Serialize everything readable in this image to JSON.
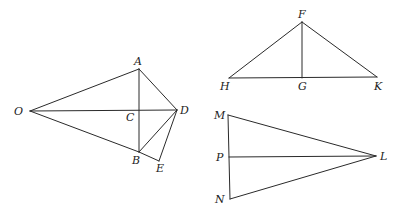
{
  "figures": [
    {
      "name": "kite-figure",
      "points": [
        "O",
        "A",
        "B",
        "C",
        "D",
        "E"
      ],
      "segments": [
        [
          "O",
          "A"
        ],
        [
          "O",
          "B"
        ],
        [
          "O",
          "D"
        ],
        [
          "A",
          "B"
        ],
        [
          "A",
          "D"
        ],
        [
          "B",
          "D"
        ],
        [
          "B",
          "E"
        ],
        [
          "D",
          "E"
        ]
      ]
    },
    {
      "name": "triangle-fhk",
      "points": [
        "F",
        "G",
        "H",
        "K"
      ],
      "segments": [
        [
          "F",
          "H"
        ],
        [
          "F",
          "K"
        ],
        [
          "H",
          "K"
        ],
        [
          "F",
          "G"
        ]
      ]
    },
    {
      "name": "triangle-lmn",
      "points": [
        "L",
        "M",
        "N",
        "P"
      ],
      "segments": [
        [
          "M",
          "L"
        ],
        [
          "N",
          "L"
        ],
        [
          "M",
          "N"
        ],
        [
          "P",
          "L"
        ]
      ]
    }
  ],
  "labels": {
    "O": "O",
    "A": "A",
    "B": "B",
    "C": "C",
    "D": "D",
    "E": "E",
    "F": "F",
    "G": "G",
    "H": "H",
    "K": "K",
    "L": "L",
    "M": "M",
    "N": "N",
    "P": "P"
  }
}
